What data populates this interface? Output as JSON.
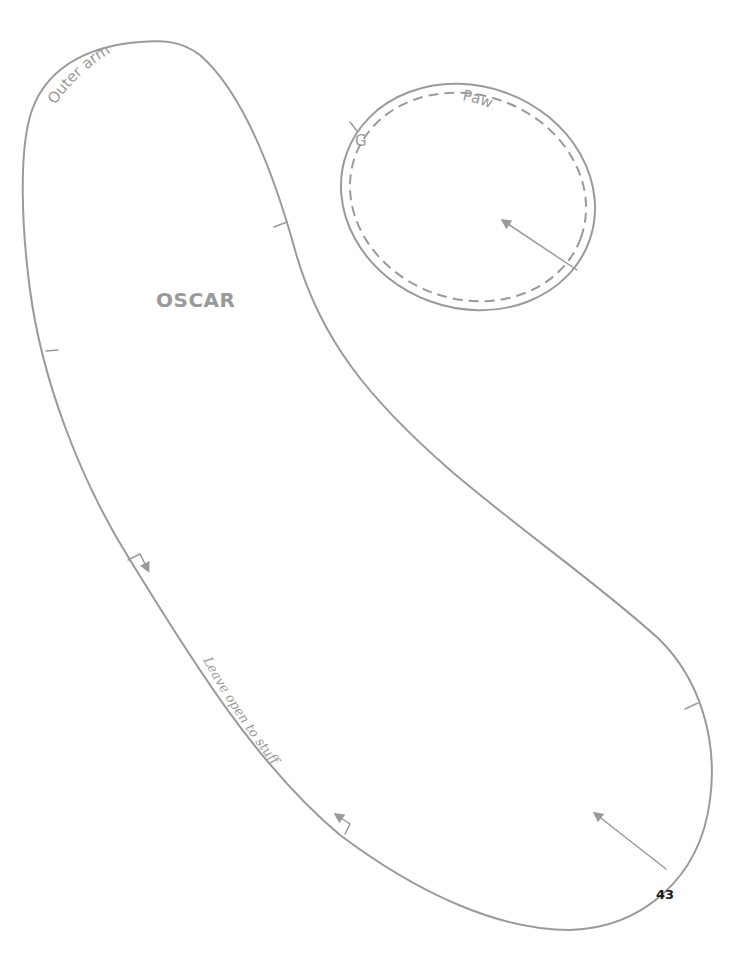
{
  "pattern": {
    "piece_name": "OSCAR",
    "outer_arm": {
      "label": "Outer arm",
      "instruction": "Leave open to stuff"
    },
    "paw": {
      "label": "Paw",
      "marker": "G"
    },
    "line_color": "#9a9a9a"
  },
  "page": {
    "number": "43"
  }
}
